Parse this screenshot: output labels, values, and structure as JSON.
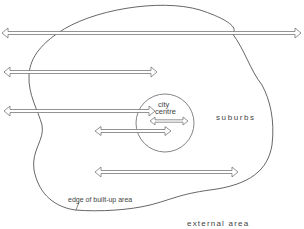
{
  "diagram": {
    "labels": {
      "city_centre_line1": "city",
      "city_centre_line2": "centre",
      "suburbs": "suburbs",
      "edge": "edge of built-up area",
      "external": "external area"
    },
    "colors": {
      "line": "#555555",
      "arrow_outline": "#777777",
      "background": "#ffffff"
    },
    "arrows": [
      {
        "id": "through-traffic",
        "x1": 2,
        "x2": 301,
        "y": 33,
        "type": "double-headed"
      },
      {
        "id": "suburb-to-external-upper",
        "x1": 4,
        "x2": 157,
        "y": 72,
        "type": "double-headed"
      },
      {
        "id": "centre-to-external",
        "x1": 4,
        "x2": 155,
        "y": 111,
        "type": "double-headed"
      },
      {
        "id": "within-centre",
        "x1": 150,
        "x2": 188,
        "y": 121,
        "type": "double-headed"
      },
      {
        "id": "suburb-to-centre",
        "x1": 95,
        "x2": 171,
        "y": 131,
        "type": "double-headed"
      },
      {
        "id": "suburb-to-suburb",
        "x1": 95,
        "x2": 238,
        "y": 172,
        "type": "double-headed"
      }
    ],
    "regions": [
      {
        "name": "built-up area",
        "shape": "irregular closed curve"
      },
      {
        "name": "city centre",
        "shape": "circle",
        "cx": 165,
        "cy": 123,
        "r": 29
      }
    ]
  }
}
